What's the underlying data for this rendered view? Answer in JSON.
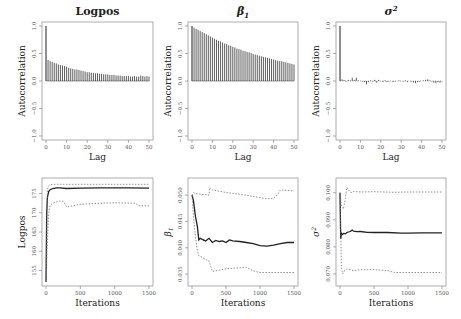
{
  "chart_data": [
    {
      "type": "bar",
      "panel": "acf",
      "title": "Logpos",
      "xlabel": "Lag",
      "ylabel": "Autocorrelation",
      "xlim": [
        0,
        50
      ],
      "ylim": [
        -1.0,
        1.0
      ],
      "xticks": [
        0,
        10,
        20,
        30,
        40,
        50
      ],
      "yticks": [
        -1.0,
        -0.5,
        0.0,
        0.5,
        1.0
      ],
      "lags": [
        0,
        1,
        2,
        3,
        4,
        5,
        6,
        7,
        8,
        9,
        10,
        11,
        12,
        13,
        14,
        15,
        16,
        17,
        18,
        19,
        20,
        21,
        22,
        23,
        24,
        25,
        26,
        27,
        28,
        29,
        30,
        31,
        32,
        33,
        34,
        35,
        36,
        37,
        38,
        39,
        40,
        41,
        42,
        43,
        44,
        45,
        46,
        47,
        48,
        49,
        50
      ],
      "values": [
        1.0,
        0.38,
        0.36,
        0.35,
        0.33,
        0.32,
        0.3,
        0.29,
        0.28,
        0.27,
        0.26,
        0.24,
        0.23,
        0.22,
        0.21,
        0.21,
        0.2,
        0.19,
        0.18,
        0.17,
        0.16,
        0.16,
        0.15,
        0.15,
        0.14,
        0.14,
        0.13,
        0.13,
        0.12,
        0.12,
        0.12,
        0.11,
        0.11,
        0.11,
        0.1,
        0.1,
        0.1,
        0.09,
        0.09,
        0.09,
        0.09,
        0.08,
        0.08,
        0.09,
        0.08,
        0.08,
        0.1,
        0.09,
        0.08,
        0.09,
        0.08
      ]
    },
    {
      "type": "bar",
      "panel": "acf",
      "title": "β1",
      "xlabel": "Lag",
      "ylabel": "Autocorrelation",
      "xlim": [
        0,
        50
      ],
      "ylim": [
        -1.0,
        1.0
      ],
      "xticks": [
        0,
        10,
        20,
        30,
        40,
        50
      ],
      "yticks": [
        -1.0,
        -0.5,
        0.0,
        0.5,
        1.0
      ],
      "lags": [
        0,
        1,
        2,
        3,
        4,
        5,
        6,
        7,
        8,
        9,
        10,
        11,
        12,
        13,
        14,
        15,
        16,
        17,
        18,
        19,
        20,
        21,
        22,
        23,
        24,
        25,
        26,
        27,
        28,
        29,
        30,
        31,
        32,
        33,
        34,
        35,
        36,
        37,
        38,
        39,
        40,
        41,
        42,
        43,
        44,
        45,
        46,
        47,
        48,
        49,
        50
      ],
      "values": [
        1.0,
        0.97,
        0.95,
        0.93,
        0.91,
        0.89,
        0.87,
        0.85,
        0.83,
        0.81,
        0.79,
        0.77,
        0.75,
        0.73,
        0.72,
        0.7,
        0.68,
        0.67,
        0.65,
        0.64,
        0.62,
        0.61,
        0.59,
        0.58,
        0.57,
        0.55,
        0.54,
        0.53,
        0.52,
        0.51,
        0.49,
        0.48,
        0.47,
        0.46,
        0.45,
        0.44,
        0.43,
        0.42,
        0.41,
        0.4,
        0.39,
        0.38,
        0.37,
        0.36,
        0.36,
        0.35,
        0.34,
        0.33,
        0.32,
        0.31,
        0.3
      ]
    },
    {
      "type": "bar",
      "panel": "acf",
      "title": "σ2",
      "xlabel": "Lag",
      "ylabel": "Autocorrelation",
      "xlim": [
        0,
        50
      ],
      "ylim": [
        -1.0,
        1.0
      ],
      "xticks": [
        0,
        10,
        20,
        30,
        40,
        50
      ],
      "yticks": [
        -1.0,
        -0.5,
        0.0,
        0.5,
        1.0
      ],
      "lags": [
        0,
        1,
        2,
        3,
        4,
        5,
        6,
        7,
        8,
        9,
        10,
        11,
        12,
        13,
        14,
        15,
        16,
        17,
        18,
        19,
        20,
        21,
        22,
        23,
        24,
        25,
        26,
        27,
        28,
        29,
        30,
        31,
        32,
        33,
        34,
        35,
        36,
        37,
        38,
        39,
        40,
        41,
        42,
        43,
        44,
        45,
        46,
        47,
        48,
        49,
        50
      ],
      "values": [
        1.0,
        0.03,
        0.02,
        -0.01,
        0.02,
        0.01,
        0.06,
        0.02,
        0.06,
        0.01,
        0.0,
        -0.01,
        -0.02,
        -0.06,
        -0.02,
        0.01,
        -0.01,
        0.02,
        -0.03,
        0.02,
        0.0,
        -0.02,
        0.01,
        -0.02,
        -0.01,
        0.0,
        -0.02,
        -0.01,
        0.0,
        0.01,
        0.0,
        -0.01,
        0.01,
        -0.02,
        0.0,
        -0.01,
        -0.03,
        -0.04,
        -0.02,
        -0.01,
        0.0,
        0.01,
        0.02,
        0.03,
        0.01,
        -0.01,
        -0.03,
        -0.04,
        -0.02,
        -0.03,
        -0.01
      ]
    },
    {
      "type": "line",
      "panel": "trace",
      "title": "",
      "xlabel": "Iterations",
      "ylabel": "Logpos",
      "xlim": [
        0,
        1500
      ],
      "ylim": [
        152,
        178
      ],
      "xticks": [
        0,
        500,
        1000,
        1500
      ],
      "yticks": [
        155,
        160,
        165,
        170,
        175
      ],
      "series": [
        {
          "name": "mean",
          "style": "solid",
          "x": [
            0,
            10,
            20,
            40,
            60,
            100,
            150,
            200,
            300,
            500,
            800,
            1000,
            1200,
            1500
          ],
          "y": [
            152,
            170,
            174,
            175.5,
            176,
            176.3,
            176.5,
            176.5,
            176.3,
            176.4,
            176.5,
            176.5,
            176.5,
            176.4
          ]
        },
        {
          "name": "upper",
          "style": "dotted",
          "x": [
            0,
            20,
            40,
            60,
            100,
            200,
            500,
            1000,
            1500
          ],
          "y": [
            152,
            176,
            177,
            177.3,
            177.4,
            177.4,
            177.4,
            177.4,
            177.4
          ]
        },
        {
          "name": "lower",
          "style": "dotted",
          "x": [
            0,
            20,
            40,
            60,
            100,
            150,
            200,
            250,
            300,
            500,
            800,
            1000,
            1300,
            1350,
            1500
          ],
          "y": [
            152,
            162,
            170,
            172,
            172.5,
            172.8,
            173,
            173,
            171.5,
            172.2,
            172.5,
            172.6,
            172.5,
            171.8,
            171.8
          ]
        }
      ]
    },
    {
      "type": "line",
      "panel": "trace",
      "title": "",
      "xlabel": "Iterations",
      "ylabel": "β1",
      "xlim": [
        0,
        1500
      ],
      "ylim": [
        0.0335,
        0.0525
      ],
      "xticks": [
        0,
        500,
        1000,
        1500
      ],
      "yticks": [
        0.035,
        0.04,
        0.045,
        0.05
      ],
      "series": [
        {
          "name": "mean",
          "style": "solid",
          "x": [
            0,
            20,
            50,
            80,
            100,
            120,
            150,
            200,
            250,
            300,
            350,
            400,
            450,
            500,
            550,
            600,
            700,
            800,
            900,
            1000,
            1100,
            1200,
            1300,
            1400,
            1500
          ],
          "y": [
            0.05,
            0.049,
            0.046,
            0.044,
            0.0415,
            0.0418,
            0.0416,
            0.0413,
            0.0418,
            0.041,
            0.0414,
            0.0412,
            0.0413,
            0.041,
            0.0415,
            0.0413,
            0.0412,
            0.041,
            0.0408,
            0.0404,
            0.0403,
            0.0405,
            0.0408,
            0.041,
            0.041
          ]
        },
        {
          "name": "upper",
          "style": "dotted",
          "x": [
            0,
            20,
            50,
            250,
            260,
            300,
            500,
            800,
            1100,
            1200,
            1250,
            1300,
            1500
          ],
          "y": [
            0.05,
            0.0505,
            0.0503,
            0.05,
            0.0515,
            0.051,
            0.0505,
            0.05,
            0.0493,
            0.0494,
            0.05,
            0.051,
            0.0508
          ]
        },
        {
          "name": "lower",
          "style": "dotted",
          "x": [
            0,
            20,
            50,
            80,
            100,
            150,
            200,
            250,
            300,
            500,
            700,
            800,
            900,
            1000,
            1500
          ],
          "y": [
            0.05,
            0.046,
            0.042,
            0.0395,
            0.0385,
            0.0382,
            0.0378,
            0.0375,
            0.0355,
            0.036,
            0.0362,
            0.0363,
            0.0356,
            0.0353,
            0.0353
          ]
        }
      ]
    },
    {
      "type": "line",
      "panel": "trace",
      "title": "",
      "xlabel": "Iterations",
      "ylabel": "σ2",
      "xlim": [
        0,
        1500
      ],
      "ylim": [
        0.067,
        0.104
      ],
      "xticks": [
        0,
        500,
        1000,
        1500
      ],
      "yticks": [
        0.07,
        0.08,
        0.09,
        0.1
      ],
      "series": [
        {
          "name": "mean",
          "style": "solid",
          "x": [
            0,
            10,
            20,
            30,
            50,
            80,
            100,
            150,
            180,
            200,
            250,
            300,
            400,
            500,
            700,
            900,
            1000,
            1200,
            1500
          ],
          "y": [
            0.1,
            0.083,
            0.085,
            0.0845,
            0.085,
            0.0848,
            0.0853,
            0.0857,
            0.0862,
            0.0858,
            0.0856,
            0.0857,
            0.0854,
            0.0853,
            0.0853,
            0.0851,
            0.0851,
            0.0852,
            0.0852
          ]
        },
        {
          "name": "upper",
          "style": "dotted",
          "x": [
            0,
            20,
            50,
            80,
            100,
            130,
            160,
            200,
            300,
            500,
            800,
            1000,
            1300,
            1500
          ],
          "y": [
            0.1,
            0.095,
            0.094,
            0.098,
            0.102,
            0.101,
            0.1,
            0.1005,
            0.1003,
            0.1004,
            0.1002,
            0.1003,
            0.1003,
            0.1003
          ]
        },
        {
          "name": "lower",
          "style": "dotted",
          "x": [
            0,
            20,
            40,
            60,
            100,
            150,
            200,
            300,
            500,
            700,
            800,
            1000,
            1500
          ],
          "y": [
            0.1,
            0.072,
            0.07,
            0.071,
            0.0718,
            0.0715,
            0.0712,
            0.0715,
            0.0716,
            0.0712,
            0.0705,
            0.0705,
            0.0705
          ]
        }
      ]
    }
  ]
}
